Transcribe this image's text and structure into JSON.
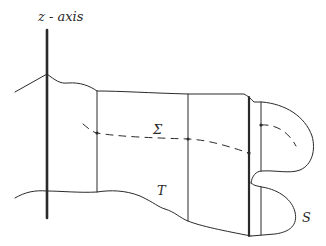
{
  "labels": {
    "axis": "z - axis",
    "sigma": "Σ",
    "t": "T",
    "s": "S"
  },
  "colors": {
    "stroke": "#2a2a2a",
    "background": "#ffffff"
  }
}
